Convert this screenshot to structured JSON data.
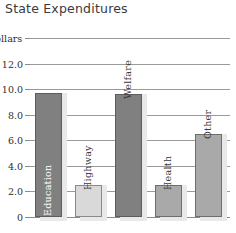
{
  "chart_data": {
    "type": "bar",
    "title": "State Expenditures",
    "xlabel": "",
    "ylabel": "billion dollars",
    "unit_label": "billion dollars",
    "categories": [
      "Education",
      "Highway",
      "Welfare",
      "Health",
      "Other"
    ],
    "values": [
      9.7,
      2.5,
      9.6,
      2.5,
      6.5
    ],
    "ylim": [
      0,
      14
    ],
    "yticks": [
      0,
      2.0,
      4.0,
      6.0,
      8.0,
      10.0,
      12.0,
      14.0
    ],
    "ytick_labels": [
      "0",
      "2.0",
      "4.0",
      "6.0",
      "8.0",
      "10.0",
      "12.0",
      "14.0"
    ],
    "grid": true,
    "legend": "none",
    "bar_styles": [
      "dark",
      "light",
      "dark",
      "mid",
      "mid"
    ],
    "label_placement": [
      "inside",
      "outside",
      "outside",
      "outside",
      "outside"
    ]
  },
  "colors": {
    "bar_dark": "#808080",
    "bar_mid": "#a9a9a9",
    "bar_light": "#d9d9d9",
    "gridline": "#9a9a9a",
    "text": "#2e2e2e",
    "background": "#ffffff"
  }
}
